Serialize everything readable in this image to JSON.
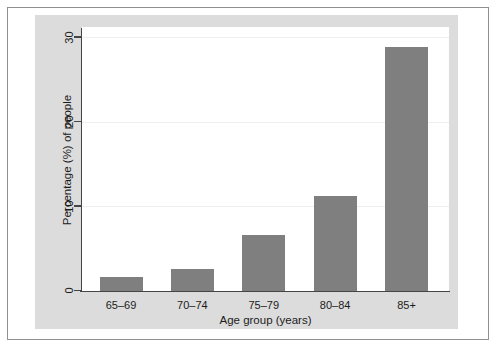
{
  "chart_data": {
    "type": "bar",
    "categories": [
      "65–69",
      "70–74",
      "75–79",
      "80–84",
      "85+"
    ],
    "values": [
      1.6,
      2.5,
      6.6,
      11.2,
      28.8
    ],
    "title": "",
    "xlabel": "Age group (years)",
    "ylabel": "Percentage (%) of people",
    "ylim": [
      0,
      30
    ],
    "yticks": [
      0,
      10,
      20,
      30
    ],
    "grid": "horizontal-faint-at-yticks",
    "legend": "none",
    "bar_color": "#7f7f7f",
    "panel_background": "#dcdcdc",
    "plot_background": "#ffffff"
  }
}
